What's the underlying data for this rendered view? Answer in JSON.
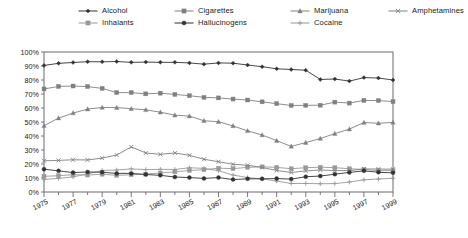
{
  "legend": {
    "items": [
      {
        "label": "Alcohol",
        "marker": "diamond",
        "color": "#333333",
        "name": "legend-item-alcohol"
      },
      {
        "label": "Cigarettes",
        "marker": "square",
        "color": "#808080",
        "name": "legend-item-cigarettes"
      },
      {
        "label": "Marijuana",
        "marker": "triangle",
        "color": "#808080",
        "name": "legend-item-marijuana"
      },
      {
        "label": "Amphetamines",
        "marker": "x",
        "color": "#808080",
        "name": "legend-item-amphetamines"
      },
      {
        "label": "Inhalants",
        "marker": "square",
        "color": "#999999",
        "name": "legend-item-inhalants"
      },
      {
        "label": "Hallucinogens",
        "marker": "circle",
        "color": "#333333",
        "name": "legend-item-hallucinogens"
      },
      {
        "label": "Cocaine",
        "marker": "plus",
        "color": "#999999",
        "name": "legend-item-cocaine"
      }
    ]
  },
  "chart_data": {
    "type": "line",
    "title": "",
    "subtitle": "",
    "xlabel": "",
    "ylabel": "",
    "xlim": [
      1975,
      1999
    ],
    "ylim": [
      0,
      100
    ],
    "grid": false,
    "legend_position": "top",
    "y_ticks": [
      "0%",
      "10%",
      "20%",
      "30%",
      "40%",
      "50%",
      "60%",
      "70%",
      "80%",
      "90%",
      "100%"
    ],
    "y_tick_values": [
      0,
      10,
      20,
      30,
      40,
      50,
      60,
      70,
      80,
      90,
      100
    ],
    "x": [
      1975,
      1976,
      1977,
      1978,
      1979,
      1980,
      1981,
      1982,
      1983,
      1984,
      1985,
      1986,
      1987,
      1988,
      1989,
      1990,
      1991,
      1992,
      1993,
      1994,
      1995,
      1996,
      1997,
      1998,
      1999
    ],
    "x_tick_labels": [
      "1975",
      "1977",
      "1979",
      "1981",
      "1983",
      "1985",
      "1987",
      "1989",
      "1991",
      "1993",
      "1995",
      "1997",
      "1999"
    ],
    "x_tick_label_values": [
      1975,
      1977,
      1979,
      1981,
      1983,
      1985,
      1987,
      1989,
      1991,
      1993,
      1995,
      1997,
      1999
    ],
    "series": [
      {
        "name": "Alcohol",
        "marker": "diamond",
        "color": "#333333",
        "values": [
          90.4,
          91.9,
          92.5,
          93.1,
          93.0,
          93.2,
          92.6,
          92.8,
          92.6,
          92.6,
          92.2,
          91.3,
          92.2,
          92.0,
          90.7,
          89.5,
          88.0,
          87.5,
          87.0,
          80.4,
          80.7,
          79.2,
          81.7,
          81.4,
          80.0
        ]
      },
      {
        "name": "Cigarettes",
        "marker": "square",
        "color": "#808080",
        "values": [
          73.6,
          75.4,
          75.7,
          75.3,
          74.0,
          71.0,
          71.0,
          70.1,
          70.6,
          69.7,
          68.8,
          67.6,
          67.2,
          66.4,
          65.7,
          64.4,
          63.1,
          61.8,
          61.9,
          62.0,
          64.2,
          63.5,
          65.4,
          65.3,
          64.6
        ]
      },
      {
        "name": "Marijuana",
        "marker": "triangle",
        "color": "#808080",
        "values": [
          47.3,
          52.8,
          56.4,
          59.2,
          60.4,
          60.3,
          59.5,
          58.7,
          57.0,
          54.9,
          54.2,
          50.9,
          50.2,
          47.2,
          43.7,
          40.7,
          36.7,
          32.6,
          35.3,
          38.2,
          41.7,
          44.9,
          49.6,
          49.1,
          49.7
        ]
      },
      {
        "name": "Amphetamines",
        "marker": "x",
        "color": "#808080",
        "values": [
          22.3,
          22.6,
          23.0,
          22.9,
          24.2,
          26.4,
          32.2,
          27.9,
          26.9,
          27.9,
          26.2,
          23.4,
          21.6,
          19.8,
          19.1,
          17.5,
          15.4,
          13.9,
          15.1,
          15.7,
          15.3,
          15.3,
          16.5,
          16.4,
          16.3
        ]
      },
      {
        "name": "Inhalants",
        "marker": "square",
        "color": "#999999",
        "values": [
          11.2,
          11.6,
          12.4,
          12.1,
          12.7,
          11.9,
          12.3,
          12.8,
          13.6,
          14.4,
          15.4,
          15.9,
          17.0,
          16.7,
          17.6,
          18.0,
          17.6,
          16.6,
          17.4,
          17.7,
          17.4,
          16.6,
          16.1,
          15.2,
          15.4
        ]
      },
      {
        "name": "Hallucinogens",
        "marker": "circle",
        "color": "#333333",
        "values": [
          16.3,
          15.1,
          13.9,
          14.3,
          14.1,
          13.3,
          13.3,
          12.5,
          11.9,
          10.7,
          10.3,
          9.7,
          10.3,
          8.9,
          9.4,
          9.4,
          9.6,
          9.2,
          10.9,
          11.4,
          12.7,
          14.0,
          15.1,
          14.1,
          13.7
        ]
      },
      {
        "name": "Cocaine",
        "marker": "plus",
        "color": "#999999",
        "values": [
          9.0,
          9.7,
          10.8,
          12.9,
          15.4,
          15.7,
          16.5,
          16.0,
          16.2,
          16.1,
          17.3,
          16.9,
          15.2,
          12.1,
          10.3,
          9.4,
          7.8,
          6.1,
          6.1,
          5.9,
          6.0,
          7.1,
          8.7,
          9.3,
          9.8
        ]
      }
    ]
  }
}
